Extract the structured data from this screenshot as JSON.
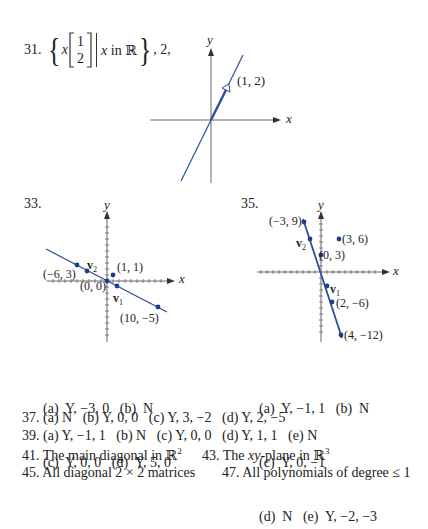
{
  "problem31": {
    "number": "31.",
    "set_var": "x",
    "vector": [
      "1",
      "2"
    ],
    "condition": "x in ℝ",
    "dimension": ", 2,",
    "graph": {
      "x_label": "x",
      "y_label": "y",
      "point_label": "(1, 2)"
    }
  },
  "problem33": {
    "number": "33.",
    "graph": {
      "x_label": "x",
      "y_label": "y",
      "points": [
        {
          "label": "(−6, 3)"
        },
        {
          "label": "(1, 1)"
        },
        {
          "label": "(0, 0)"
        },
        {
          "label": "(10, −5)"
        }
      ],
      "v1": "v",
      "v1_sub": "1",
      "v2": "v",
      "v2_sub": "2"
    },
    "answers": [
      "(a)  Y, −3, 0   (b)  N",
      "(c)  Y, 0, 0   (d)  Y, 5, 0"
    ]
  },
  "problem35": {
    "number": "35.",
    "graph": {
      "x_label": "x",
      "y_label": "y",
      "points": [
        {
          "label": "(−3, 9)"
        },
        {
          "label": "(3, 6)"
        },
        {
          "label": "(0, 3)"
        },
        {
          "label": "(2, −6)"
        },
        {
          "label": "(4, −12)"
        }
      ],
      "v1": "v",
      "v1_sub": "1",
      "v2": "v",
      "v2_sub": "2"
    },
    "answers": [
      "(a)  Y, −1, 1   (b)  N",
      "(c)  Y, 0, −1",
      "(d)  N   (e)  Y, −2, −3"
    ]
  },
  "lines": [
    "37. (a) N   (b) Y, 0, 0   (c) Y, 3, −2   (d) Y, 2, −5",
    "39. (a) Y, −1, 1   (b) N   (c) Y, 0, 0   (d) Y, 1, 1   (e) N"
  ],
  "problem41": {
    "text": "41. The main diagonal in ℝ",
    "sup": "2"
  },
  "problem43": {
    "pre": "43. The ",
    "italic": "xy",
    "post": "-plane in ℝ",
    "sup": "3"
  },
  "problem45": {
    "text": "45. All diagonal 2 × 2 matrices"
  },
  "problem47": {
    "text": "47. All polynomials of degree ≤ 1"
  },
  "colors": {
    "line": "#2a4f9e",
    "axis": "#555555"
  }
}
